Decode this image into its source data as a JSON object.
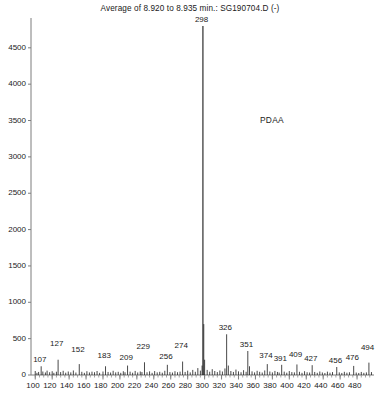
{
  "chart_data": {
    "type": "bar",
    "title": "Average of 8.920 to 8.935 min.: SG190704.D (-)",
    "subtitle": "",
    "xlabel": "",
    "ylabel": "",
    "grid": false,
    "legend_position": "none",
    "xlim": [
      95,
      500
    ],
    "ylim": [
      0,
      4800
    ],
    "ytick_labels": [
      "0",
      "500",
      "1000",
      "1500",
      "2000",
      "2500",
      "3000",
      "3500",
      "4000",
      "4500"
    ],
    "ytick_values": [
      0,
      500,
      1000,
      1500,
      2000,
      2500,
      3000,
      3500,
      4000,
      4500
    ],
    "xtick_labels": [
      "100",
      "120",
      "140",
      "160",
      "180",
      "200",
      "220",
      "240",
      "260",
      "280",
      "300",
      "320",
      "340",
      "360",
      "380",
      "400",
      "420",
      "440",
      "460",
      "480"
    ],
    "xtick_values": [
      100,
      120,
      140,
      160,
      180,
      200,
      220,
      240,
      260,
      280,
      300,
      320,
      340,
      360,
      380,
      400,
      420,
      440,
      460,
      480
    ],
    "annotations": [
      {
        "text": "PDAA",
        "x": 383,
        "y": 3500
      }
    ],
    "labeled_peaks": [
      {
        "mz": 107,
        "intensity": 120,
        "label": "107",
        "label_dy": 0
      },
      {
        "mz": 127,
        "intensity": 210,
        "label": "127",
        "label_dy": 10
      },
      {
        "mz": 152,
        "intensity": 150,
        "label": "152",
        "label_dy": 8
      },
      {
        "mz": 183,
        "intensity": 120,
        "label": "183",
        "label_dy": 4
      },
      {
        "mz": 209,
        "intensity": 130,
        "label": "209",
        "label_dy": 2
      },
      {
        "mz": 229,
        "intensity": 175,
        "label": "229",
        "label_dy": 9
      },
      {
        "mz": 256,
        "intensity": 140,
        "label": "256",
        "label_dy": 2
      },
      {
        "mz": 274,
        "intensity": 185,
        "label": "274",
        "label_dy": 10
      },
      {
        "mz": 298,
        "intensity": 4800,
        "label": "298",
        "label_dy": 0
      },
      {
        "mz": 326,
        "intensity": 560,
        "label": "326",
        "label_dy": 0
      },
      {
        "mz": 351,
        "intensity": 330,
        "label": "351",
        "label_dy": 0
      },
      {
        "mz": 374,
        "intensity": 150,
        "label": "374",
        "label_dy": 2
      },
      {
        "mz": 391,
        "intensity": 140,
        "label": "391",
        "label_dy": 0
      },
      {
        "mz": 409,
        "intensity": 145,
        "label": "409",
        "label_dy": 3
      },
      {
        "mz": 427,
        "intensity": 135,
        "label": "427",
        "label_dy": 0
      },
      {
        "mz": 456,
        "intensity": 110,
        "label": "456",
        "label_dy": 0
      },
      {
        "mz": 476,
        "intensity": 125,
        "label": "476",
        "label_dy": 2
      },
      {
        "mz": 494,
        "intensity": 170,
        "label": "494",
        "label_dy": 9
      }
    ],
    "peaks": [
      {
        "mz": 100,
        "intensity": 55
      },
      {
        "mz": 102,
        "intensity": 30
      },
      {
        "mz": 104,
        "intensity": 42
      },
      {
        "mz": 107,
        "intensity": 120
      },
      {
        "mz": 109,
        "intensity": 48
      },
      {
        "mz": 112,
        "intensity": 35
      },
      {
        "mz": 114,
        "intensity": 60
      },
      {
        "mz": 117,
        "intensity": 38
      },
      {
        "mz": 120,
        "intensity": 52
      },
      {
        "mz": 122,
        "intensity": 30
      },
      {
        "mz": 125,
        "intensity": 45
      },
      {
        "mz": 127,
        "intensity": 210
      },
      {
        "mz": 130,
        "intensity": 40
      },
      {
        "mz": 133,
        "intensity": 58
      },
      {
        "mz": 136,
        "intensity": 32
      },
      {
        "mz": 139,
        "intensity": 48
      },
      {
        "mz": 142,
        "intensity": 36
      },
      {
        "mz": 145,
        "intensity": 62
      },
      {
        "mz": 148,
        "intensity": 34
      },
      {
        "mz": 152,
        "intensity": 150
      },
      {
        "mz": 155,
        "intensity": 44
      },
      {
        "mz": 158,
        "intensity": 30
      },
      {
        "mz": 161,
        "intensity": 52
      },
      {
        "mz": 164,
        "intensity": 35
      },
      {
        "mz": 167,
        "intensity": 46
      },
      {
        "mz": 170,
        "intensity": 38
      },
      {
        "mz": 173,
        "intensity": 55
      },
      {
        "mz": 176,
        "intensity": 30
      },
      {
        "mz": 180,
        "intensity": 48
      },
      {
        "mz": 183,
        "intensity": 120
      },
      {
        "mz": 186,
        "intensity": 42
      },
      {
        "mz": 189,
        "intensity": 34
      },
      {
        "mz": 192,
        "intensity": 58
      },
      {
        "mz": 195,
        "intensity": 36
      },
      {
        "mz": 198,
        "intensity": 44
      },
      {
        "mz": 201,
        "intensity": 30
      },
      {
        "mz": 204,
        "intensity": 52
      },
      {
        "mz": 206,
        "intensity": 38
      },
      {
        "mz": 209,
        "intensity": 130
      },
      {
        "mz": 212,
        "intensity": 46
      },
      {
        "mz": 215,
        "intensity": 32
      },
      {
        "mz": 218,
        "intensity": 56
      },
      {
        "mz": 221,
        "intensity": 35
      },
      {
        "mz": 224,
        "intensity": 48
      },
      {
        "mz": 226,
        "intensity": 40
      },
      {
        "mz": 229,
        "intensity": 175
      },
      {
        "mz": 232,
        "intensity": 38
      },
      {
        "mz": 235,
        "intensity": 50
      },
      {
        "mz": 238,
        "intensity": 30
      },
      {
        "mz": 241,
        "intensity": 54
      },
      {
        "mz": 244,
        "intensity": 36
      },
      {
        "mz": 247,
        "intensity": 44
      },
      {
        "mz": 250,
        "intensity": 32
      },
      {
        "mz": 253,
        "intensity": 58
      },
      {
        "mz": 256,
        "intensity": 140
      },
      {
        "mz": 259,
        "intensity": 40
      },
      {
        "mz": 262,
        "intensity": 34
      },
      {
        "mz": 265,
        "intensity": 52
      },
      {
        "mz": 268,
        "intensity": 38
      },
      {
        "mz": 271,
        "intensity": 46
      },
      {
        "mz": 274,
        "intensity": 185
      },
      {
        "mz": 277,
        "intensity": 42
      },
      {
        "mz": 280,
        "intensity": 60
      },
      {
        "mz": 283,
        "intensity": 36
      },
      {
        "mz": 286,
        "intensity": 70
      },
      {
        "mz": 289,
        "intensity": 44
      },
      {
        "mz": 292,
        "intensity": 95
      },
      {
        "mz": 295,
        "intensity": 60
      },
      {
        "mz": 297,
        "intensity": 130
      },
      {
        "mz": 298,
        "intensity": 4800
      },
      {
        "mz": 299,
        "intensity": 700
      },
      {
        "mz": 300,
        "intensity": 210
      },
      {
        "mz": 303,
        "intensity": 70
      },
      {
        "mz": 306,
        "intensity": 45
      },
      {
        "mz": 309,
        "intensity": 80
      },
      {
        "mz": 312,
        "intensity": 55
      },
      {
        "mz": 315,
        "intensity": 40
      },
      {
        "mz": 318,
        "intensity": 62
      },
      {
        "mz": 321,
        "intensity": 48
      },
      {
        "mz": 324,
        "intensity": 90
      },
      {
        "mz": 326,
        "intensity": 560
      },
      {
        "mz": 328,
        "intensity": 130
      },
      {
        "mz": 331,
        "intensity": 55
      },
      {
        "mz": 334,
        "intensity": 42
      },
      {
        "mz": 337,
        "intensity": 75
      },
      {
        "mz": 340,
        "intensity": 50
      },
      {
        "mz": 343,
        "intensity": 38
      },
      {
        "mz": 346,
        "intensity": 66
      },
      {
        "mz": 349,
        "intensity": 44
      },
      {
        "mz": 351,
        "intensity": 330
      },
      {
        "mz": 353,
        "intensity": 120
      },
      {
        "mz": 356,
        "intensity": 50
      },
      {
        "mz": 359,
        "intensity": 36
      },
      {
        "mz": 362,
        "intensity": 58
      },
      {
        "mz": 365,
        "intensity": 44
      },
      {
        "mz": 368,
        "intensity": 34
      },
      {
        "mz": 371,
        "intensity": 62
      },
      {
        "mz": 374,
        "intensity": 150
      },
      {
        "mz": 377,
        "intensity": 48
      },
      {
        "mz": 380,
        "intensity": 36
      },
      {
        "mz": 383,
        "intensity": 56
      },
      {
        "mz": 386,
        "intensity": 42
      },
      {
        "mz": 388,
        "intensity": 34
      },
      {
        "mz": 391,
        "intensity": 140
      },
      {
        "mz": 394,
        "intensity": 46
      },
      {
        "mz": 397,
        "intensity": 32
      },
      {
        "mz": 400,
        "intensity": 54
      },
      {
        "mz": 403,
        "intensity": 40
      },
      {
        "mz": 406,
        "intensity": 36
      },
      {
        "mz": 409,
        "intensity": 145
      },
      {
        "mz": 412,
        "intensity": 44
      },
      {
        "mz": 415,
        "intensity": 30
      },
      {
        "mz": 418,
        "intensity": 52
      },
      {
        "mz": 421,
        "intensity": 38
      },
      {
        "mz": 424,
        "intensity": 34
      },
      {
        "mz": 427,
        "intensity": 135
      },
      {
        "mz": 430,
        "intensity": 42
      },
      {
        "mz": 433,
        "intensity": 30
      },
      {
        "mz": 436,
        "intensity": 48
      },
      {
        "mz": 439,
        "intensity": 35
      },
      {
        "mz": 442,
        "intensity": 28
      },
      {
        "mz": 445,
        "intensity": 46
      },
      {
        "mz": 448,
        "intensity": 32
      },
      {
        "mz": 451,
        "intensity": 40
      },
      {
        "mz": 456,
        "intensity": 110
      },
      {
        "mz": 459,
        "intensity": 36
      },
      {
        "mz": 462,
        "intensity": 28
      },
      {
        "mz": 465,
        "intensity": 44
      },
      {
        "mz": 468,
        "intensity": 32
      },
      {
        "mz": 471,
        "intensity": 38
      },
      {
        "mz": 476,
        "intensity": 125
      },
      {
        "mz": 479,
        "intensity": 34
      },
      {
        "mz": 482,
        "intensity": 28
      },
      {
        "mz": 485,
        "intensity": 42
      },
      {
        "mz": 488,
        "intensity": 30
      },
      {
        "mz": 491,
        "intensity": 36
      },
      {
        "mz": 494,
        "intensity": 170
      },
      {
        "mz": 497,
        "intensity": 40
      }
    ],
    "colors": {
      "trace": "#1a1a1a",
      "axis": "#7d7d7d",
      "text": "#1a1a1a",
      "background": "#ffffff"
    }
  }
}
